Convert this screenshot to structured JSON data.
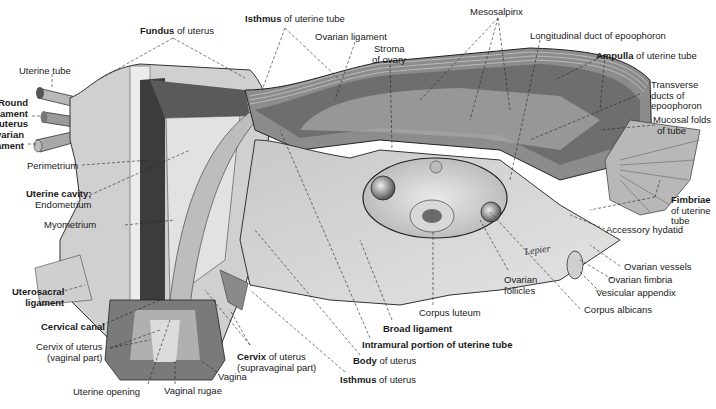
{
  "figure": {
    "signature": "Lepier",
    "colors": {
      "background": "#ffffff",
      "tissue_light": "#d6d6d6",
      "tissue_mid": "#a8a8a8",
      "tissue_dark": "#4a4a4a",
      "leader_line": "#222222"
    }
  },
  "labels": {
    "fundus": {
      "bold": "Fundus",
      "rest": " of uterus"
    },
    "isthmus_tube": {
      "bold": "Isthmus",
      "rest": " of uterine tube"
    },
    "ovarian_ligament_top": "Ovarian ligament",
    "stroma_1": "Stroma",
    "stroma_2": "of ovary",
    "mesosalpinx": "Mesosalpinx",
    "long_duct": "Longitudinal duct of epoophoron",
    "ampulla": {
      "bold": "Ampulla",
      "rest": " of uterine tube"
    },
    "transverse_1": "Transverse",
    "transverse_2": "ducts of",
    "transverse_3": "epoophoron",
    "mucosal_1": "Mucosal folds",
    "mucosal_2": "of tube",
    "fimbriae_1": "Fimbriae",
    "fimbriae_2": "of uterine",
    "fimbriae_3": "tube",
    "accessory_hydatid": "Accessory hydatid",
    "ovarian_vessels": "Ovarian vessels",
    "ovarian_fimbria": "Ovarian fimbria",
    "vesicular_appendix": "Vesicular appendix",
    "corpus_albicans": "Corpus albicans",
    "ovarian_follicles_1": "Ovarian",
    "ovarian_follicles_2": "follicles",
    "corpus_luteum": "Corpus luteum",
    "broad_ligament": "Broad ligament",
    "intramural": "Intramural portion of uterine tube",
    "body": {
      "bold": "Body",
      "rest": " of uterus"
    },
    "isthmus_uterus": {
      "bold": "Isthmus",
      "rest": " of uterus"
    },
    "cervix_supra_1": {
      "bold": "Cervix",
      "rest": " of uterus"
    },
    "cervix_supra_2": "(supravaginal part)",
    "vagina": "Vagina",
    "vaginal_rugae": "Vaginal rugae",
    "uterine_opening": "Uterine opening",
    "cervix_vaginal_1": "Cervix of uterus",
    "cervix_vaginal_2": "(vaginal part)",
    "cervical_canal": "Cervical canal",
    "uterosacral_1": "Uterosacral",
    "uterosacral_2": "ligament",
    "myometrium": "Myometrium",
    "uterine_cavity": "Uterine cavity;",
    "endometrium": "Endometrium",
    "perimetrium": "Perimetrium",
    "uterine_tube": "Uterine tube",
    "round_lig_1": "Round",
    "round_lig_2": "ligament",
    "round_lig_3": "of uterus",
    "ovarian_lig_1": "Ovarian",
    "ovarian_lig_2": "ligament"
  }
}
